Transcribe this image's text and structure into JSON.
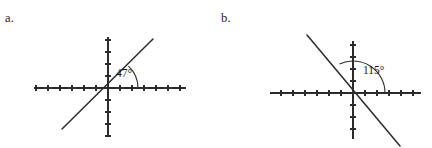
{
  "figure": {
    "background_color": "#ffffff",
    "ink_color": "#2b2b2b",
    "text_color": "#1a1a1a",
    "width": 432,
    "height": 148
  },
  "panels": [
    {
      "key": "a",
      "label": "a.",
      "label_x": 5,
      "label_y": 12,
      "angle_value": 47,
      "angle_label": "47°",
      "angle_label_x": 116,
      "angle_label_y": 77,
      "origin_x": 108,
      "origin_y": 88,
      "x_axis_start": 34,
      "x_axis_end": 186,
      "y_axis_start": 37,
      "y_axis_end": 136,
      "tick_spacing": 12,
      "x_ticks_left": 6,
      "x_ticks_right": 6,
      "y_ticks_up": 4,
      "y_ticks_down": 4,
      "tick_half_length": 3,
      "line_end_upper_x": 153,
      "line_end_upper_y": 39,
      "line_end_lower_x": 62,
      "line_end_lower_y": 129,
      "arc_radius": 30,
      "arc_start_x": 138,
      "arc_start_y": 88,
      "arc_end_x": 128.5,
      "arc_end_y": 66.1,
      "arc_sweep": 0,
      "arc_large": 0
    },
    {
      "key": "b",
      "label": "b.",
      "label_x": 5,
      "label_y": 12,
      "angle_value": 115,
      "angle_label": "115°",
      "angle_label_x": 147,
      "angle_label_y": 74,
      "origin_x": 137,
      "origin_y": 93,
      "x_axis_start": 54,
      "x_axis_end": 205,
      "y_axis_start": 41,
      "y_axis_end": 139,
      "tick_spacing": 12,
      "x_ticks_left": 6,
      "x_ticks_right": 5,
      "y_ticks_up": 4,
      "y_ticks_down": 4,
      "tick_half_length": 3,
      "line_end_upper_x": 91,
      "line_end_upper_y": 35,
      "line_end_lower_x": 184,
      "line_end_lower_y": 146,
      "arc_radius": 32,
      "arc_start_x": 169,
      "arc_start_y": 93,
      "arc_end_x": 123.5,
      "arc_end_y": 64.0,
      "arc_sweep": 0,
      "arc_large": 0
    }
  ]
}
